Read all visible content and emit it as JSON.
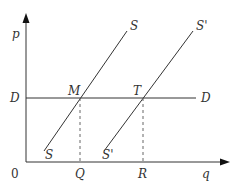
{
  "diagram": {
    "axes": {
      "y_label": "p",
      "x_label": "q",
      "origin_label": "0"
    },
    "demand_line": {
      "left_label": "D",
      "right_label": "D"
    },
    "supply_curves": [
      {
        "name": "S",
        "top_label": "S",
        "bottom_label": "S"
      },
      {
        "name": "S'",
        "top_label": "S'",
        "bottom_label": "S'"
      }
    ],
    "intersections": [
      {
        "label": "M"
      },
      {
        "label": "T"
      }
    ],
    "x_ticks": [
      {
        "label": "Q"
      },
      {
        "label": "R"
      }
    ],
    "colors": {
      "line": "#333333",
      "dashed": "#666666"
    }
  }
}
